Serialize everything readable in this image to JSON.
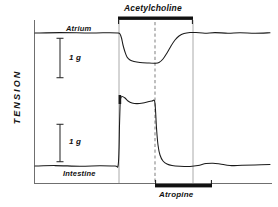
{
  "figure": {
    "axis_label_y": "TENSION",
    "traces": [
      {
        "name": "atrium",
        "label": "Atrium"
      },
      {
        "name": "intestine",
        "label": "Intestine"
      }
    ],
    "drug_bars": [
      {
        "name": "acetylcholine",
        "label": "Acetylcholine",
        "position": "top"
      },
      {
        "name": "atropine",
        "label": "Atropine",
        "position": "bottom"
      }
    ],
    "scale_bars": [
      {
        "name": "scale-bar-atrium",
        "label": "1 g"
      },
      {
        "name": "scale-bar-intestine",
        "label": "1 g"
      }
    ],
    "colors": {
      "ink": "#111111",
      "trace": "#1a1a1a",
      "grid": "#999999",
      "dashed": "#8a8a8a",
      "background": "#ffffff"
    }
  },
  "chart_data": {
    "type": "line",
    "title": "",
    "xlabel": "",
    "ylabel": "TENSION",
    "grid": false,
    "legend": "none",
    "xlim": [
      0,
      278
    ],
    "ylim": [
      0,
      207
    ],
    "annotations": [
      {
        "text": "Acetylcholine",
        "type": "drug-bar",
        "x_start": 118,
        "x_end": 193,
        "y": 20
      },
      {
        "text": "Atropine",
        "type": "drug-bar",
        "x_start": 155,
        "x_end": 212,
        "y": 184
      },
      {
        "text": "Atrium",
        "type": "trace-label",
        "x": 66,
        "y": 30
      },
      {
        "text": "Intestine",
        "type": "trace-label",
        "x": 63,
        "y": 176
      },
      {
        "text": "1 g",
        "type": "scale-label",
        "x": 69,
        "y": 59
      },
      {
        "text": "1 g",
        "type": "scale-label",
        "x": 69,
        "y": 143
      }
    ],
    "event_markers": [
      {
        "name": "acetylcholine-onset",
        "x": 119,
        "style": "solid-vertical"
      },
      {
        "name": "atropine-onset",
        "x": 155,
        "style": "dashed-vertical"
      },
      {
        "name": "washout",
        "x": 193,
        "style": "solid-vertical"
      }
    ],
    "series": [
      {
        "name": "atrium",
        "description": "Atrial tension falls sharply on acetylcholine, recovers after atropine",
        "points": [
          [
            35,
            33
          ],
          [
            60,
            32.6
          ],
          [
            90,
            33
          ],
          [
            110,
            32.7
          ],
          [
            118,
            33
          ],
          [
            120,
            34
          ],
          [
            121.5,
            38
          ],
          [
            123,
            45
          ],
          [
            125,
            52
          ],
          [
            127,
            57
          ],
          [
            130,
            60
          ],
          [
            134,
            61.5
          ],
          [
            140,
            62.5
          ],
          [
            148,
            63
          ],
          [
            155,
            63.2
          ],
          [
            159,
            62.5
          ],
          [
            163,
            59
          ],
          [
            167,
            53
          ],
          [
            171,
            46
          ],
          [
            175,
            40
          ],
          [
            179,
            36
          ],
          [
            184,
            33.5
          ],
          [
            190,
            32.5
          ],
          [
            196,
            32.6
          ],
          [
            205,
            33.2
          ],
          [
            215,
            32.6
          ],
          [
            228,
            33.2
          ],
          [
            240,
            32.7
          ],
          [
            255,
            33.2
          ],
          [
            270,
            32.8
          ]
        ]
      },
      {
        "name": "intestine",
        "description": "Intestinal tone rises on acetylcholine, collapses on atropine",
        "points": [
          [
            35,
            166
          ],
          [
            55,
            165.6
          ],
          [
            80,
            166.2
          ],
          [
            100,
            165.7
          ],
          [
            115,
            166
          ],
          [
            118,
            166
          ],
          [
            119,
            150
          ],
          [
            119.5,
            125
          ],
          [
            120,
            108
          ],
          [
            120.5,
            99
          ],
          [
            122,
            96.5
          ],
          [
            125,
            98
          ],
          [
            128,
            101
          ],
          [
            132,
            103
          ],
          [
            137,
            103.6
          ],
          [
            143,
            103
          ],
          [
            148,
            101.8
          ],
          [
            152,
            101
          ],
          [
            154.5,
            100.8
          ],
          [
            155.5,
            110
          ],
          [
            156.5,
            128
          ],
          [
            158,
            145
          ],
          [
            160,
            155
          ],
          [
            163,
            161
          ],
          [
            167,
            164
          ],
          [
            172,
            165.5
          ],
          [
            180,
            166.2
          ],
          [
            190,
            166.4
          ],
          [
            198,
            165.6
          ],
          [
            206,
            163.6
          ],
          [
            213,
            163.2
          ],
          [
            220,
            164
          ],
          [
            230,
            165.6
          ],
          [
            242,
            165.2
          ],
          [
            255,
            165
          ],
          [
            270,
            164.6
          ]
        ]
      }
    ]
  }
}
